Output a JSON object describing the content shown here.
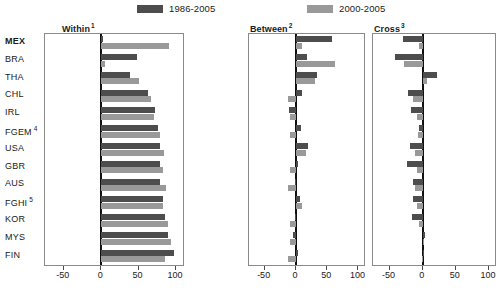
{
  "legend": {
    "items": [
      {
        "label": "1986-2005",
        "color": "#4d4d4d"
      },
      {
        "label": "2000-2005",
        "color": "#999999"
      }
    ]
  },
  "colors": {
    "series1": "#4d4d4d",
    "series2": "#999999",
    "axis": "#8a8a8a",
    "zeroline": "#111111"
  },
  "panels": [
    {
      "title": "Within",
      "note": "1"
    },
    {
      "title": "Between",
      "note": "2"
    },
    {
      "title": "Cross",
      "note": "3"
    }
  ],
  "countries": [
    {
      "code": "MEX",
      "note": "",
      "bold": true
    },
    {
      "code": "BRA",
      "note": "",
      "bold": false
    },
    {
      "code": "THA",
      "note": "",
      "bold": false
    },
    {
      "code": "CHL",
      "note": "",
      "bold": false
    },
    {
      "code": "IRL",
      "note": "",
      "bold": false
    },
    {
      "code": "FGEM",
      "note": "4",
      "bold": false
    },
    {
      "code": "USA",
      "note": "",
      "bold": false
    },
    {
      "code": "GBR",
      "note": "",
      "bold": false
    },
    {
      "code": "AUS",
      "note": "",
      "bold": false
    },
    {
      "code": "FGHI",
      "note": "5",
      "bold": false
    },
    {
      "code": "KOR",
      "note": "",
      "bold": false
    },
    {
      "code": "MYS",
      "note": "",
      "bold": false
    },
    {
      "code": "FIN",
      "note": "",
      "bold": false
    }
  ],
  "axis": {
    "ticks": [
      -50,
      0,
      50,
      100
    ],
    "tick_labels": [
      "-50",
      "0",
      "50",
      "100"
    ],
    "xlim": [
      -75,
      112
    ]
  },
  "chart_data": {
    "type": "bar",
    "title": "",
    "orientation": "horizontal",
    "xlabel": "",
    "ylabel": "",
    "xlim": [
      -75,
      112
    ],
    "grid": false,
    "legend_position": "top",
    "categories": [
      "MEX",
      "BRA",
      "THA",
      "CHL",
      "IRL",
      "FGEM",
      "USA",
      "GBR",
      "AUS",
      "FGHI",
      "KOR",
      "MYS",
      "FIN"
    ],
    "panels": [
      {
        "name": "Within",
        "note": "1",
        "series": [
          {
            "name": "1986-2005",
            "values": [
              2,
              48,
              38,
              63,
              72,
              76,
              79,
              78,
              79,
              83,
              85,
              89,
              97
            ]
          },
          {
            "name": "2000-2005",
            "values": [
              90,
              5,
              50,
              67,
              71,
              79,
              84,
              83,
              87,
              82,
              89,
              93,
              85
            ]
          }
        ]
      },
      {
        "name": "Between",
        "note": "2",
        "series": [
          {
            "name": "1986-2005",
            "values": [
              57,
              17,
              33,
              10,
              -11,
              8,
              20,
              3,
              -1,
              6,
              -2,
              -4,
              4
            ]
          },
          {
            "name": "2000-2005",
            "values": [
              10,
              63,
              30,
              -13,
              -9,
              -10,
              16,
              -9,
              -13,
              9,
              -10,
              -9,
              -13
            ]
          }
        ]
      },
      {
        "name": "Cross",
        "note": "3",
        "series": [
          {
            "name": "1986-2005",
            "values": [
              -30,
              -42,
              22,
              -22,
              -18,
              -5,
              -19,
              -24,
              -15,
              -15,
              -16,
              3,
              0
            ]
          },
          {
            "name": "2000-2005",
            "values": [
              -5,
              -28,
              6,
              -15,
              -9,
              -7,
              -11,
              -9,
              -12,
              -8,
              -6,
              2,
              -1
            ]
          }
        ]
      }
    ]
  },
  "layout": {
    "panel_x": [
      44,
      248,
      372
    ],
    "panel_w": [
      140,
      117,
      124
    ],
    "panel_top": 33,
    "panel_h": 233,
    "row_h": 17.8,
    "title_y": 22,
    "title_x": [
      62,
      250,
      374
    ]
  }
}
